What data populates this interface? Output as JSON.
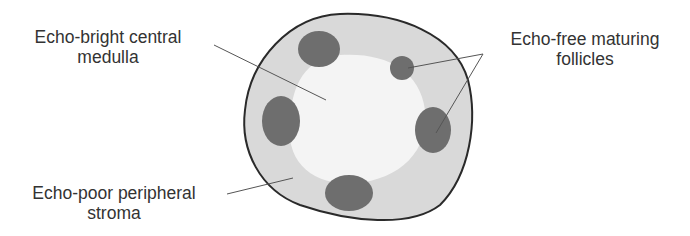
{
  "diagram": {
    "colors": {
      "outline": "#2a2a2a",
      "stroma": "#d9d9d9",
      "medulla": "#f4f4f4",
      "follicle": "#6e6e6e",
      "leader": "#555555",
      "text": "#333333"
    },
    "labels": {
      "medulla": {
        "line1": "Echo-bright central",
        "line2": "medulla"
      },
      "stroma": {
        "line1": "Echo-poor peripheral",
        "line2": "stroma"
      },
      "follicles": {
        "line1": "Echo-free maturing",
        "line2": "follicles"
      }
    }
  }
}
